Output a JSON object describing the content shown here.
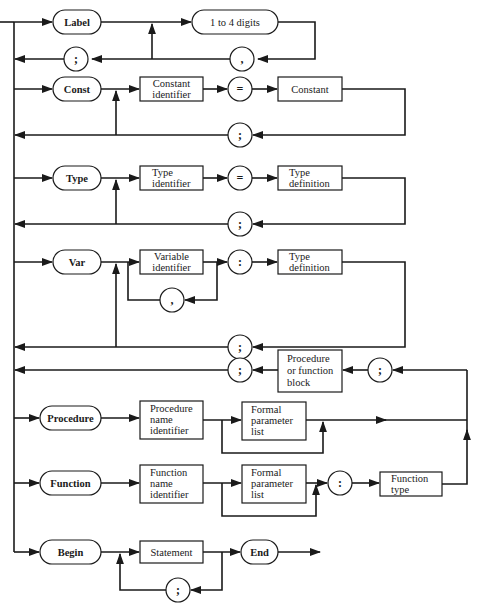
{
  "diagram": {
    "type": "syntax-diagram",
    "label_section": {
      "keyword": "Label",
      "item": "1 to 4 digits",
      "separator": ",",
      "terminator": ";"
    },
    "const_section": {
      "keyword": "Const",
      "identifier": "Constant identifier",
      "identifier_lines": [
        "Constant",
        "identifier"
      ],
      "equals": "=",
      "value": "Constant",
      "terminator": ";"
    },
    "type_section": {
      "keyword": "Type",
      "identifier_lines": [
        "Type",
        "identifier"
      ],
      "equals": "=",
      "definition_lines": [
        "Type",
        "definition"
      ],
      "terminator": ";"
    },
    "var_section": {
      "keyword": "Var",
      "identifier_lines": [
        "Variable",
        "identifier"
      ],
      "separator": ",",
      "colon": ":",
      "definition_lines": [
        "Type",
        "definition"
      ],
      "terminator": ";"
    },
    "block_section": {
      "leading_terminator": ";",
      "block_lines": [
        "Procedure",
        "or function",
        "block"
      ],
      "trailing_terminator": ";"
    },
    "procedure_section": {
      "keyword": "Procedure",
      "identifier_lines": [
        "Procedure",
        "name",
        "identifier"
      ],
      "params_lines": [
        "Formal",
        "parameter",
        "list"
      ]
    },
    "function_section": {
      "keyword": "Function",
      "identifier_lines": [
        "Function",
        "name",
        "identifier"
      ],
      "params_lines": [
        "Formal",
        "parameter",
        "list"
      ],
      "colon": ":",
      "type_lines": [
        "Function",
        "type"
      ]
    },
    "begin_section": {
      "keyword": "Begin",
      "statement": "Statement",
      "separator": ";",
      "end_keyword": "End"
    }
  }
}
